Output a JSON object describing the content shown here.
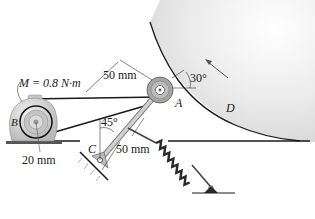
{
  "diagram": {
    "type": "mechanism",
    "labels": {
      "moment": "M = 0.8 N·m",
      "motor": "B",
      "pulley": "A",
      "drum": "D",
      "pin": "C",
      "dim_motor_radius": "20 mm",
      "dim_arm_upper": "50 mm",
      "dim_arm_lower": "50 mm",
      "angle_arm": "45°",
      "angle_contact": "30°"
    },
    "caption": ""
  },
  "colors": {
    "line": "#1a1a1a",
    "drum_fill": "#e6e6e6",
    "pulley_fill": "#a8a8a8",
    "motor_fill": "#cfcfcf",
    "spring": "#2a2a2a"
  }
}
